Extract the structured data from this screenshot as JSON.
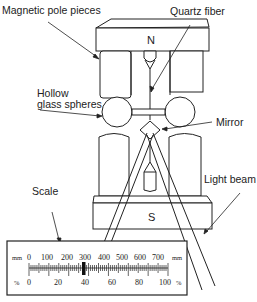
{
  "diagram": {
    "type": "torsion-balance-magnetometer",
    "labels": {
      "magnetic_pole_pieces": "Magnetic pole pieces",
      "quartz_fiber": "Quartz fiber",
      "hollow_glass_spheres_line1": "Hollow",
      "hollow_glass_spheres_line2": "glass spheres",
      "mirror": "Mirror",
      "light_beam": "Light beam",
      "scale": "Scale"
    },
    "poles": {
      "north": "N",
      "south": "S"
    },
    "scale": {
      "top_unit": "mm",
      "bottom_unit": "%",
      "mm_ticks": [
        "0",
        "100",
        "200",
        "300",
        "400",
        "500",
        "600",
        "700"
      ],
      "percent_ticks": [
        "0",
        "20",
        "40",
        "60",
        "80",
        "100"
      ]
    },
    "colors": {
      "line": "#222222",
      "background": "#ffffff"
    }
  }
}
